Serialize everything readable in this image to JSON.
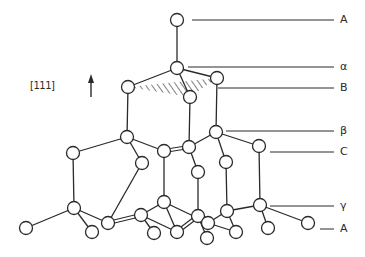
{
  "figure": {
    "title": "",
    "direction_label": "[111]",
    "direction_arrow": "up-arrow-icon"
  },
  "layer_labels": [
    {
      "id": "A_top",
      "text": "A",
      "y": 20,
      "x_from": 192
    },
    {
      "id": "alpha",
      "text": "α",
      "y": 67,
      "x_from": 188
    },
    {
      "id": "B",
      "text": "B",
      "y": 88,
      "x_from": 218
    },
    {
      "id": "beta",
      "text": "β",
      "y": 131,
      "x_from": 226
    },
    {
      "id": "C",
      "text": "C",
      "y": 152,
      "x_from": 270
    },
    {
      "id": "gamma",
      "text": "γ",
      "y": 206,
      "x_from": 270
    },
    {
      "id": "A_bottom",
      "text": "A",
      "y": 229,
      "x_from": 320
    }
  ],
  "atoms": [
    {
      "id": 0,
      "x": 177,
      "y": 20
    },
    {
      "id": 1,
      "x": 177,
      "y": 68
    },
    {
      "id": 2,
      "x": 128,
      "y": 87
    },
    {
      "id": 3,
      "x": 217,
      "y": 78
    },
    {
      "id": 4,
      "x": 190,
      "y": 97
    },
    {
      "id": 5,
      "x": 127,
      "y": 137
    },
    {
      "id": 6,
      "x": 216,
      "y": 132
    },
    {
      "id": 7,
      "x": 73,
      "y": 153
    },
    {
      "id": 8,
      "x": 142,
      "y": 163
    },
    {
      "id": 9,
      "x": 164,
      "y": 151
    },
    {
      "id": 10,
      "x": 189,
      "y": 147
    },
    {
      "id": 11,
      "x": 259,
      "y": 146
    },
    {
      "id": 12,
      "x": 198,
      "y": 172
    },
    {
      "id": 13,
      "x": 226,
      "y": 162
    },
    {
      "id": 14,
      "x": 26,
      "y": 228
    },
    {
      "id": 15,
      "x": 74,
      "y": 208
    },
    {
      "id": 16,
      "x": 92,
      "y": 232
    },
    {
      "id": 17,
      "x": 108,
      "y": 223
    },
    {
      "id": 18,
      "x": 141,
      "y": 215
    },
    {
      "id": 19,
      "x": 164,
      "y": 202
    },
    {
      "id": 20,
      "x": 154,
      "y": 233
    },
    {
      "id": 21,
      "x": 177,
      "y": 232
    },
    {
      "id": 22,
      "x": 198,
      "y": 216
    },
    {
      "id": 23,
      "x": 208,
      "y": 223
    },
    {
      "id": 24,
      "x": 207,
      "y": 238
    },
    {
      "id": 25,
      "x": 227,
      "y": 211
    },
    {
      "id": 26,
      "x": 236,
      "y": 232
    },
    {
      "id": 27,
      "x": 260,
      "y": 205
    },
    {
      "id": 28,
      "x": 268,
      "y": 228
    },
    {
      "id": 29,
      "x": 308,
      "y": 223
    }
  ],
  "bonds": [
    [
      0,
      1
    ],
    [
      1,
      2
    ],
    [
      1,
      3
    ],
    [
      1,
      4
    ],
    [
      2,
      5
    ],
    [
      3,
      6
    ],
    [
      4,
      10
    ],
    [
      5,
      7
    ],
    [
      5,
      8
    ],
    [
      5,
      9
    ],
    [
      6,
      10
    ],
    [
      6,
      11
    ],
    [
      6,
      13
    ],
    [
      9,
      10
    ],
    [
      10,
      12
    ],
    [
      7,
      15
    ],
    [
      8,
      17
    ],
    [
      9,
      19
    ],
    [
      12,
      22
    ],
    [
      13,
      25
    ],
    [
      11,
      27
    ],
    [
      15,
      14
    ],
    [
      15,
      16
    ],
    [
      15,
      17
    ],
    [
      17,
      18
    ],
    [
      18,
      19
    ],
    [
      18,
      20
    ],
    [
      18,
      21
    ],
    [
      19,
      21
    ],
    [
      19,
      23
    ],
    [
      21,
      22
    ],
    [
      22,
      24
    ],
    [
      22,
      23
    ],
    [
      23,
      25
    ],
    [
      25,
      26
    ],
    [
      25,
      27
    ],
    [
      23,
      26
    ],
    [
      27,
      28
    ],
    [
      27,
      29
    ]
  ],
  "double_bonds": [
    [
      17,
      18
    ],
    [
      9,
      10
    ],
    [
      21,
      22
    ]
  ],
  "shaded_plane": [
    [
      128,
      87
    ],
    [
      217,
      78
    ],
    [
      190,
      97
    ]
  ],
  "colors": {
    "ink": "#2a2a2a",
    "atom_fill": "#ffffff",
    "background": "#ffffff"
  }
}
